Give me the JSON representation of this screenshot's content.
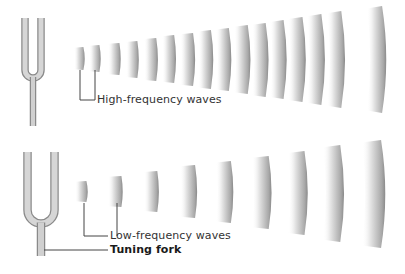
{
  "colors": {
    "background": "#ffffff",
    "fork_fill": "#c8c8c8",
    "fork_edge": "#8a8a8a",
    "wave_light": "#ffffff",
    "wave_dark": "#8e8e8e",
    "leader_line": "#444444",
    "text": "#333333"
  },
  "panels": [
    {
      "name": "high-frequency",
      "label": "High-frequency waves",
      "wave_count": 16,
      "waves": [
        {
          "x": 74,
          "w": 10,
          "y1": 47,
          "y2": 70
        },
        {
          "x": 89,
          "w": 11,
          "y1": 45,
          "y2": 72
        },
        {
          "x": 108,
          "w": 12,
          "y1": 43,
          "y2": 75
        },
        {
          "x": 126,
          "w": 12,
          "y1": 41,
          "y2": 78
        },
        {
          "x": 144,
          "w": 13,
          "y1": 38,
          "y2": 81
        },
        {
          "x": 162,
          "w": 13,
          "y1": 35,
          "y2": 83
        },
        {
          "x": 180,
          "w": 14,
          "y1": 33,
          "y2": 86
        },
        {
          "x": 198,
          "w": 14,
          "y1": 30,
          "y2": 89
        },
        {
          "x": 216,
          "w": 14,
          "y1": 28,
          "y2": 91
        },
        {
          "x": 234,
          "w": 15,
          "y1": 25,
          "y2": 94
        },
        {
          "x": 252,
          "w": 15,
          "y1": 23,
          "y2": 97
        },
        {
          "x": 270,
          "w": 15,
          "y1": 20,
          "y2": 99
        },
        {
          "x": 288,
          "w": 16,
          "y1": 17,
          "y2": 102
        },
        {
          "x": 307,
          "w": 16,
          "y1": 14,
          "y2": 105
        },
        {
          "x": 327,
          "w": 16,
          "y1": 11,
          "y2": 108
        },
        {
          "x": 367,
          "w": 17,
          "y1": 6,
          "y2": 113
        }
      ],
      "fork": {
        "cx": 33,
        "top": 18,
        "bend": 70,
        "stem_bottom": 126,
        "prong_gap": 10,
        "prong_w": 6,
        "stem_w": 5
      },
      "leader": {
        "x1": 80,
        "x2": 95,
        "top": 70,
        "y": 100,
        "text_x": 97,
        "text_y": 94
      }
    },
    {
      "name": "low-frequency",
      "label": "Low-frequency waves",
      "wave_count": 9,
      "waves": [
        {
          "x": 75,
          "w": 12,
          "y1": 181,
          "y2": 202
        },
        {
          "x": 108,
          "w": 14,
          "y1": 176,
          "y2": 207
        },
        {
          "x": 144,
          "w": 14,
          "y1": 171,
          "y2": 212
        },
        {
          "x": 180,
          "w": 16,
          "y1": 165,
          "y2": 218
        },
        {
          "x": 216,
          "w": 16,
          "y1": 161,
          "y2": 223
        },
        {
          "x": 252,
          "w": 18,
          "y1": 156,
          "y2": 229
        },
        {
          "x": 288,
          "w": 18,
          "y1": 151,
          "y2": 235
        },
        {
          "x": 323,
          "w": 19,
          "y1": 145,
          "y2": 242
        },
        {
          "x": 362,
          "w": 21,
          "y1": 140,
          "y2": 248
        }
      ],
      "fork": {
        "cx": 41,
        "top": 152,
        "bend": 210,
        "stem_bottom": 256,
        "prong_gap": 20,
        "prong_w": 7,
        "stem_w": 7
      },
      "leader": {
        "x1": 84,
        "x2": 117,
        "top": 203,
        "y": 236,
        "text_x": 110,
        "text_y": 230
      }
    }
  ],
  "callouts": {
    "high_frequency": "High-frequency waves",
    "low_frequency": "Low-frequency waves",
    "tuning_fork": "Tuning fork"
  },
  "tuning_fork_leader": {
    "x1": 44,
    "x2": 108,
    "y": 250,
    "text_x": 110,
    "text_y": 244
  }
}
